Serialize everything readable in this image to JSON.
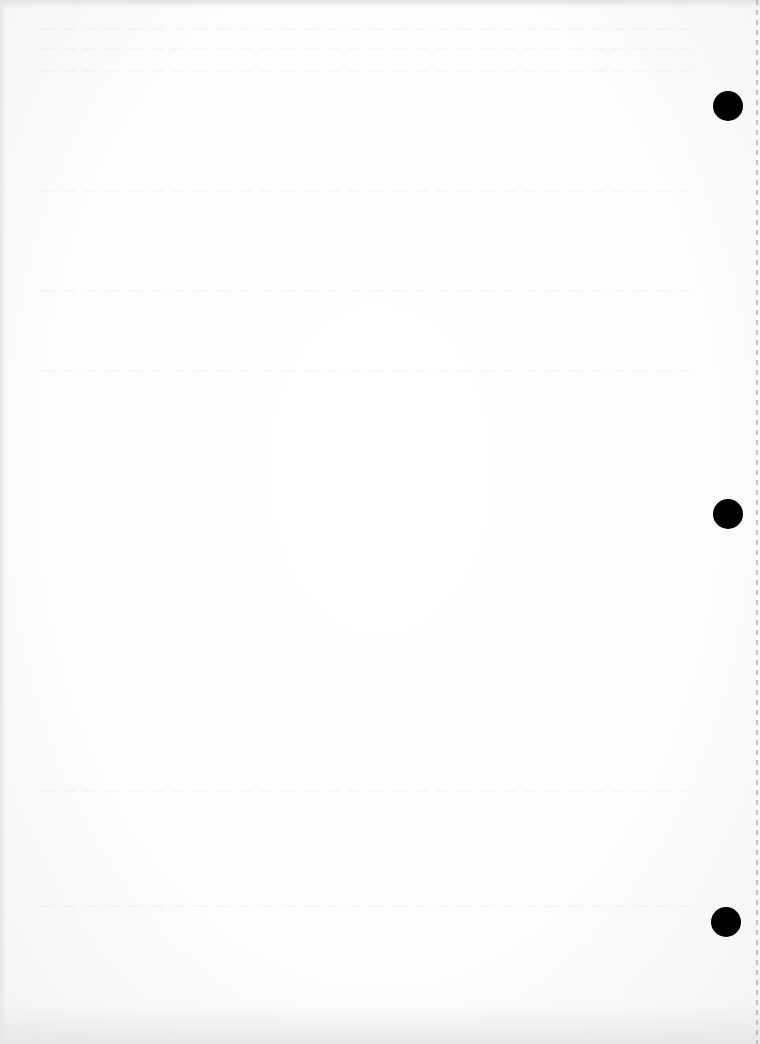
{
  "document": {
    "type": "blank-scanned-page",
    "text_content": "",
    "background_color": "#fdfdfd",
    "punch_holes": [
      {
        "cx": 728,
        "cy": 106
      },
      {
        "cx": 728,
        "cy": 514
      },
      {
        "cx": 726,
        "cy": 922
      }
    ],
    "punch_hole_color": "#000000"
  }
}
